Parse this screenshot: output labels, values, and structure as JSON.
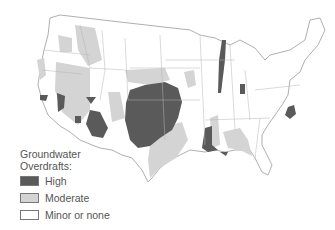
{
  "map": {
    "subject": "United States groundwater overdrafts",
    "colors": {
      "high": "#5a5a5a",
      "moderate": "#d4d4d4",
      "minor": "#ffffff",
      "border": "#9a9a9a"
    }
  },
  "legend": {
    "title_line1": "Groundwater",
    "title_line2": "Overdrafts:",
    "items": [
      {
        "label": "High",
        "color": "#5a5a5a"
      },
      {
        "label": "Moderate",
        "color": "#d4d4d4"
      },
      {
        "label": "Minor or none",
        "color": "#ffffff"
      }
    ]
  }
}
